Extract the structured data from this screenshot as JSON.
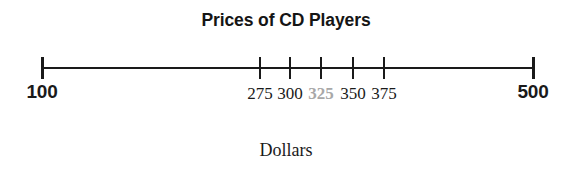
{
  "chart_data": {
    "type": "number-line",
    "title": "Prices of CD Players",
    "xlabel": "Dollars",
    "ylabel": "",
    "grid": false,
    "legend": "none",
    "axis_min": 100,
    "axis_max": 500,
    "scale_note": "broken / non-linear axis: 100 and 500 endpoints are far from the clustered inner ticks",
    "ticks": [
      {
        "value": 100,
        "label": "100",
        "x": 42,
        "style": "endpoint",
        "color": "#1a1a1a",
        "bold": true
      },
      {
        "value": 275,
        "label": "275",
        "x": 260,
        "style": "inner",
        "color": "#1a1a1a",
        "bold": false
      },
      {
        "value": 300,
        "label": "300",
        "x": 290,
        "style": "inner",
        "color": "#1a1a1a",
        "bold": false
      },
      {
        "value": 325,
        "label": "325",
        "x": 321,
        "style": "inner",
        "color": "#a8a8a8",
        "bold": true
      },
      {
        "value": 350,
        "label": "350",
        "x": 353,
        "style": "inner",
        "color": "#1a1a1a",
        "bold": false
      },
      {
        "value": 375,
        "label": "375",
        "x": 384,
        "style": "inner",
        "color": "#1a1a1a",
        "bold": false
      },
      {
        "value": 500,
        "label": "500",
        "x": 533,
        "style": "endpoint",
        "color": "#1a1a1a",
        "bold": true
      }
    ],
    "highlighted_value": 325,
    "highlight_color": "#a8a8a8",
    "line_color": "#1a1a1a",
    "background_color": "#ffffff"
  },
  "figure": {
    "title": "Prices of CD Players",
    "caption": "Dollars"
  }
}
